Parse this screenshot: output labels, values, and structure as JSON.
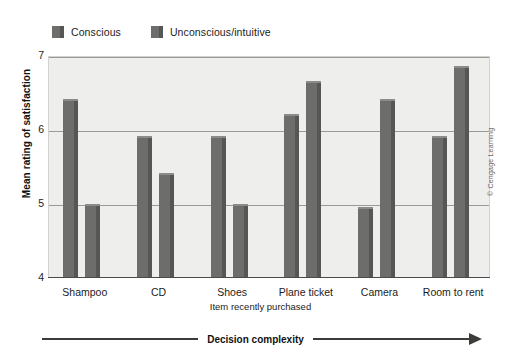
{
  "chart_data": {
    "type": "bar",
    "title": "",
    "subtitle": "",
    "xlabel": "Item recently purchased",
    "ylabel": "Mean rating of satisfaction",
    "ylim": [
      4,
      7
    ],
    "yticks": [
      4,
      5,
      6,
      7
    ],
    "ytick_labels": [
      "4",
      "5",
      "6",
      "7"
    ],
    "grid": true,
    "grid_axis": "y",
    "legend_position": "top-left",
    "categories": [
      "Shampoo",
      "CD",
      "Shoes",
      "Plane ticket",
      "Camera",
      "Room to rent"
    ],
    "series": [
      {
        "name": "Conscious",
        "color": "#6d6d6b",
        "values": [
          6.4,
          5.9,
          5.9,
          6.2,
          4.95,
          5.9
        ]
      },
      {
        "name": "Unconscious/intuitive",
        "color": "#6d6d6b",
        "values": [
          4.98,
          5.4,
          4.98,
          6.65,
          6.4,
          6.85
        ]
      }
    ],
    "annotations": [
      {
        "text": "Decision complexity",
        "position": "below-axis",
        "arrow": "right"
      }
    ],
    "credit": "© Cengage Learning"
  },
  "legend": {
    "entries": [
      {
        "label": "Conscious"
      },
      {
        "label": "Unconscious/intuitive"
      }
    ]
  },
  "colors": {
    "bar_face": "#6d6d6b",
    "bar_side": "#565654",
    "bar_top": "#8b8b88",
    "plot_background": "#eeeeec",
    "gridline": "#9a9a97",
    "axis": "#4a4a48",
    "text": "#1c1c1c"
  }
}
